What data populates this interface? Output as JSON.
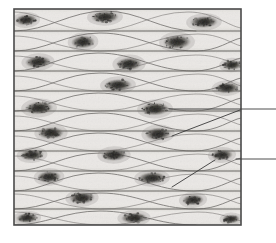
{
  "figure": {
    "tissue_type": "smooth muscle",
    "view": "longitudinal section",
    "caption_faint": "",
    "colors": {
      "background": "#ffffff",
      "frame_border": "#4a4a4a",
      "tissue_fill": "#e9e7e4",
      "band_line": "#5c5a57",
      "cell_outline": "#6b6966",
      "nucleus_dark": "#2b2a28",
      "nucleus_mid": "#55534f",
      "leader_line": "#3a3a3a"
    },
    "frame": {
      "x": 14,
      "y": 9,
      "width": 227,
      "height": 216,
      "stroke_width": 1.6
    },
    "bands": [
      {
        "index": 0,
        "y_top": 9,
        "y_bottom": 31
      },
      {
        "index": 1,
        "y_top": 31,
        "y_bottom": 51
      },
      {
        "index": 2,
        "y_top": 51,
        "y_bottom": 71
      },
      {
        "index": 3,
        "y_top": 71,
        "y_bottom": 91
      },
      {
        "index": 4,
        "y_top": 91,
        "y_bottom": 111
      },
      {
        "index": 5,
        "y_top": 111,
        "y_bottom": 131
      },
      {
        "index": 6,
        "y_top": 131,
        "y_bottom": 151
      },
      {
        "index": 7,
        "y_top": 151,
        "y_bottom": 171
      },
      {
        "index": 8,
        "y_top": 171,
        "y_bottom": 191
      },
      {
        "index": 9,
        "y_top": 191,
        "y_bottom": 209
      },
      {
        "index": 10,
        "y_top": 209,
        "y_bottom": 225
      }
    ],
    "band_separators": [
      31,
      51,
      71,
      91,
      111,
      131,
      151,
      171,
      191,
      209
    ],
    "nuclei": [
      {
        "id": "n01",
        "cx": 26,
        "cy": 20,
        "rx": 11,
        "ry": 5.5,
        "angle": -4
      },
      {
        "id": "n02",
        "cx": 105,
        "cy": 17,
        "rx": 14,
        "ry": 6,
        "angle": -2
      },
      {
        "id": "n03",
        "cx": 204,
        "cy": 22,
        "rx": 14,
        "ry": 6,
        "angle": -2
      },
      {
        "id": "n04",
        "cx": 83,
        "cy": 42,
        "rx": 12,
        "ry": 6.5,
        "angle": -3
      },
      {
        "id": "n05",
        "cx": 177,
        "cy": 42,
        "rx": 14,
        "ry": 7,
        "angle": -2
      },
      {
        "id": "n06",
        "cx": 38,
        "cy": 62,
        "rx": 13,
        "ry": 6,
        "angle": -3
      },
      {
        "id": "n07",
        "cx": 129,
        "cy": 64,
        "rx": 13,
        "ry": 6.5,
        "angle": -2
      },
      {
        "id": "n08",
        "cx": 232,
        "cy": 65,
        "rx": 10,
        "ry": 5,
        "angle": -3
      },
      {
        "id": "n09",
        "cx": 118,
        "cy": 85,
        "rx": 14,
        "ry": 6,
        "angle": -2
      },
      {
        "id": "n10",
        "cx": 227,
        "cy": 88,
        "rx": 12,
        "ry": 5.5,
        "angle": -3
      },
      {
        "id": "n11",
        "cx": 39,
        "cy": 108,
        "rx": 14,
        "ry": 6.5,
        "angle": -3
      },
      {
        "id": "n12",
        "cx": 155,
        "cy": 109,
        "rx": 14,
        "ry": 6.5,
        "angle": -2
      },
      {
        "id": "n13",
        "cx": 51,
        "cy": 133,
        "rx": 13,
        "ry": 6,
        "angle": -2
      },
      {
        "id": "n14",
        "cx": 158,
        "cy": 134,
        "rx": 13,
        "ry": 6.5,
        "angle": -3
      },
      {
        "id": "n15",
        "cx": 32,
        "cy": 155,
        "rx": 12,
        "ry": 5.5,
        "angle": -3
      },
      {
        "id": "n16",
        "cx": 114,
        "cy": 155,
        "rx": 13,
        "ry": 6,
        "angle": -2
      },
      {
        "id": "n17",
        "cx": 222,
        "cy": 155,
        "rx": 11,
        "ry": 5.5,
        "angle": -4
      },
      {
        "id": "n18",
        "cx": 49,
        "cy": 177,
        "rx": 12,
        "ry": 6,
        "angle": -3
      },
      {
        "id": "n19",
        "cx": 152,
        "cy": 178,
        "rx": 14,
        "ry": 6,
        "angle": -2
      },
      {
        "id": "n20",
        "cx": 82,
        "cy": 198,
        "rx": 13,
        "ry": 6,
        "angle": -3
      },
      {
        "id": "n21",
        "cx": 193,
        "cy": 200,
        "rx": 11,
        "ry": 5.5,
        "angle": -3
      },
      {
        "id": "n22",
        "cx": 27,
        "cy": 218,
        "rx": 11,
        "ry": 5,
        "angle": -3
      },
      {
        "id": "n23",
        "cx": 134,
        "cy": 218,
        "rx": 13,
        "ry": 5.5,
        "angle": -2
      },
      {
        "id": "n24",
        "cx": 231,
        "cy": 219,
        "rx": 9,
        "ry": 4.5,
        "angle": -3
      }
    ],
    "cell_outlines": [
      "M14,31 C48,31 70,11 105,11 C140,11 160,31 196,31",
      "M14,12 C40,12 58,30 96,31 C132,32 150,12 188,12 C214,12 228,26 241,28",
      "M14,51 C46,51 66,33 100,33 C138,33 156,51 196,51 C218,51 230,40 241,38",
      "M14,36 C44,36 60,50 100,51 C140,52 158,34 198,34 C220,34 232,44 241,46",
      "M14,71 C44,71 62,53 98,53 C136,53 154,71 194,71 C216,71 230,60 241,58",
      "M14,56 C42,56 60,70 98,71 C138,72 156,55 196,55 C220,55 232,64 241,66",
      "M14,91 C46,91 64,73 100,73 C138,73 156,91 196,91 C218,91 230,80 241,78",
      "M14,76 C44,76 60,90 100,91 C140,92 158,74 198,74 C220,74 232,84 241,86",
      "M14,111 C44,111 62,93 98,93 C136,93 154,111 194,111 C216,111 230,100 241,98",
      "M14,96 C42,96 60,110 98,111 C138,112 156,94 196,94 C220,94 232,103 241,105",
      "M14,131 C46,131 64,113 100,113 C138,113 156,131 196,131 C218,131 230,120 241,118",
      "M14,116 C44,116 60,130 100,131 C140,132 158,114 198,114 C220,114 232,123 241,125",
      "M14,151 C44,151 62,133 98,133 C136,133 154,151 194,151 C216,151 230,140 241,138",
      "M14,136 C42,136 60,150 98,151 C138,152 156,134 196,134 C220,134 232,143 241,145",
      "M14,171 C46,171 64,153 100,153 C138,153 156,171 196,171 C218,171 230,160 241,158",
      "M14,156 C44,156 60,170 100,171 C140,172 158,154 198,154 C220,154 232,163 241,165",
      "M14,191 C44,191 62,173 98,173 C136,173 154,191 194,191 C216,191 230,180 241,178",
      "M14,176 C42,176 60,190 98,191 C138,192 156,174 196,174 C220,174 232,183 241,185",
      "M14,209 C46,209 64,193 100,193 C138,193 156,209 196,209 C218,209 230,199 241,197",
      "M14,194 C44,194 60,208 100,209 C140,210 158,194 198,194 C220,194 232,202 241,204",
      "M14,225 C46,225 64,211 100,211 C138,211 156,225 196,225",
      "M14,212 C44,212 60,224 100,225 C140,226 158,212 198,212 C220,212 232,219 241,221"
    ],
    "leader_lines": [
      {
        "id": "leader-1",
        "points": "169,109 236,109 276,109",
        "origin_nucleus": "n12",
        "description": "horizontal leader from nucleus to right label (label off-frame)"
      },
      {
        "id": "leader-2",
        "points": "172,136 240,110",
        "origin_nucleus": "n14",
        "description": "diagonal leader rising from lower nucleus to right label (label off-frame)"
      },
      {
        "id": "leader-3",
        "points": "172,187 215,160",
        "origin_nucleus": "n19",
        "description": "diagonal leader rising toward right label (label off-frame)"
      },
      {
        "id": "leader-4",
        "points": "236,159 276,159",
        "origin_nucleus": "n17",
        "description": "horizontal leader to right label (label off-frame)"
      }
    ],
    "labels": [
      {
        "id": "label-1",
        "text": "",
        "visible": false,
        "note": "label text cropped off right edge"
      },
      {
        "id": "label-2",
        "text": "",
        "visible": false,
        "note": "label text cropped off right edge"
      }
    ]
  }
}
